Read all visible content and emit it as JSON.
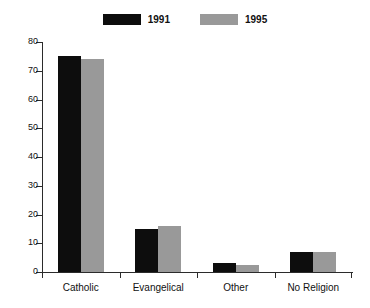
{
  "chart_data": {
    "type": "bar",
    "title": "",
    "subtitle": "",
    "xlabel": "",
    "ylabel": "",
    "categories": [
      "Catholic",
      "Evangelical",
      "Other",
      "No Religion"
    ],
    "series": [
      {
        "name": "1991",
        "color": "#0d0d0d",
        "values": [
          75,
          15,
          3,
          7
        ]
      },
      {
        "name": "1995",
        "color": "#999999",
        "values": [
          74,
          16,
          2.5,
          7
        ]
      }
    ],
    "ylim": [
      0,
      80
    ],
    "yticks": [
      0,
      10,
      20,
      30,
      40,
      50,
      60,
      70,
      80
    ],
    "ytick_labels": [
      "0",
      "10",
      "20",
      "30",
      "40",
      "50",
      "60",
      "70",
      "80"
    ],
    "grid": false,
    "legend_position": "top-center"
  },
  "legend": {
    "entries": [
      {
        "label": "1991",
        "swatch": "#0d0d0d"
      },
      {
        "label": "1995",
        "swatch": "#999999"
      }
    ]
  },
  "axes": {
    "y_tick_labels": [
      "80",
      "70",
      "60",
      "50",
      "40",
      "30",
      "20",
      "10",
      "0"
    ],
    "x_category_labels": [
      "Catholic",
      "Evangelical",
      "Other",
      "No Religion"
    ]
  }
}
